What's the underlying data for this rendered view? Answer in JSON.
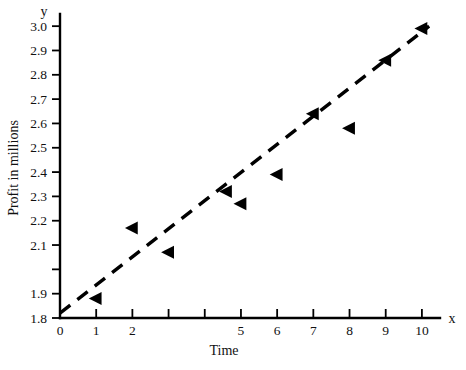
{
  "chart_data": {
    "type": "scatter",
    "title": "",
    "xlabel": "Time",
    "ylabel": "Profit  in millions",
    "x_axis_letter": "x",
    "y_axis_letter": "y",
    "xlim": [
      0,
      10.5
    ],
    "ylim": [
      1.8,
      3.05
    ],
    "grid": false,
    "legend": null,
    "marker_style": "left-pointing-triangle",
    "x_ticks": [
      0,
      1,
      2,
      3,
      4,
      5,
      6,
      7,
      8,
      9,
      10
    ],
    "x_tick_labels": [
      "0",
      "1",
      "2",
      "",
      "",
      "5",
      "6",
      "7",
      "8",
      "9",
      "10"
    ],
    "y_ticks": [
      1.8,
      1.9,
      2.0,
      2.1,
      2.2,
      2.3,
      2.4,
      2.5,
      2.6,
      2.7,
      2.8,
      2.9,
      3.0
    ],
    "y_tick_labels": [
      "1.8",
      "1.9",
      "",
      "2.1",
      "2.2",
      "2.3",
      "2.4",
      "2.5",
      "2.6",
      "2.7",
      "2.8",
      "2.9",
      "3.0"
    ],
    "x": [
      1,
      2,
      3,
      5,
      6,
      7,
      8,
      9,
      10
    ],
    "y": [
      1.88,
      2.17,
      2.07,
      2.27,
      2.39,
      2.64,
      2.58,
      2.86,
      2.99
    ],
    "points": [
      {
        "x": 1,
        "y": 1.88
      },
      {
        "x": 2,
        "y": 2.17
      },
      {
        "x": 3,
        "y": 2.07
      },
      {
        "x": 4.6,
        "y": 2.32
      },
      {
        "x": 5,
        "y": 2.27
      },
      {
        "x": 6,
        "y": 2.39
      },
      {
        "x": 7,
        "y": 2.64
      },
      {
        "x": 8,
        "y": 2.58
      },
      {
        "x": 9,
        "y": 2.86
      },
      {
        "x": 10,
        "y": 2.99
      }
    ],
    "trend_line": {
      "style": "dashed",
      "x_start": 0,
      "y_start": 1.82,
      "x_end": 10.2,
      "y_end": 3.0
    },
    "colors": {
      "marker": "#000000",
      "axis": "#000000",
      "trend": "#000000",
      "background": "#ffffff"
    }
  }
}
